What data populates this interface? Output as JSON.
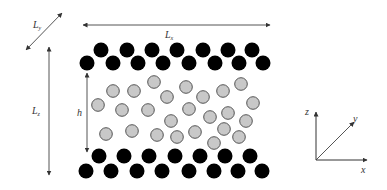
{
  "labels": {
    "Ly": {
      "main": "L",
      "sub": "y"
    },
    "Lx": {
      "main": "L",
      "sub": "x"
    },
    "Lz": {
      "main": "L",
      "sub": "z"
    },
    "h": "h",
    "axis_x": "x",
    "axis_y": "y",
    "axis_z": "z"
  },
  "colors": {
    "wall_atom": "#000000",
    "fluid_atom_fill": "#c8c8c8",
    "fluid_atom_stroke": "#555555",
    "arrow": "#555555"
  },
  "wall_top": {
    "upper_row": {
      "y": 50,
      "x": [
        101,
        127,
        152,
        177,
        203,
        228,
        252
      ]
    },
    "lower_row": {
      "y": 63,
      "x": [
        87,
        113,
        138,
        163,
        189,
        215,
        239,
        263
      ]
    }
  },
  "wall_bottom": {
    "upper_row": {
      "y": 156,
      "x": [
        99,
        124,
        149,
        175,
        200,
        225,
        250
      ]
    },
    "lower_row": {
      "y": 171,
      "x": [
        86,
        111,
        137,
        162,
        189,
        214,
        238,
        262
      ]
    }
  },
  "fluid_atoms": [
    [
      113,
      91
    ],
    [
      134,
      91
    ],
    [
      154,
      82
    ],
    [
      98,
      105
    ],
    [
      167,
      97
    ],
    [
      122,
      110
    ],
    [
      148,
      110
    ],
    [
      171,
      121
    ],
    [
      106,
      134
    ],
    [
      132,
      131
    ],
    [
      157,
      135
    ],
    [
      177,
      137
    ],
    [
      186,
      87
    ],
    [
      203,
      97
    ],
    [
      223,
      91
    ],
    [
      241,
      84
    ],
    [
      253,
      103
    ],
    [
      189,
      109
    ],
    [
      210,
      117
    ],
    [
      228,
      113
    ],
    [
      246,
      121
    ],
    [
      195,
      132
    ],
    [
      224,
      129
    ],
    [
      239,
      137
    ],
    [
      214,
      143
    ]
  ]
}
